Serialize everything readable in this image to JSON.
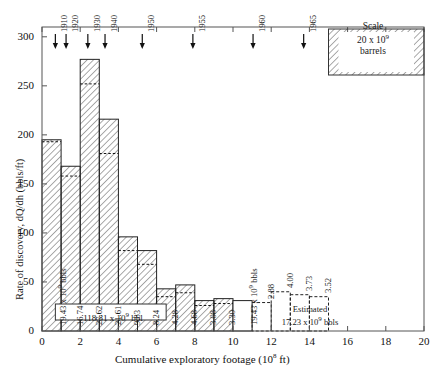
{
  "chart_data": {
    "type": "bar",
    "title": "",
    "xlabel": "Cumulative exploratory footage (10⁸ ft)",
    "ylabel": "Rate of discovery, dQ/dh (bbls/ft)",
    "xlim": [
      0,
      20
    ],
    "ylim": [
      0,
      310
    ],
    "xticks": [
      0,
      2,
      4,
      6,
      8,
      10,
      12,
      14,
      16,
      18,
      20
    ],
    "yticks": [
      0,
      50,
      100,
      150,
      200,
      250,
      300
    ],
    "grid": false,
    "legend": "none",
    "bar_width_units": 1,
    "bars": [
      {
        "x0": 0,
        "x1": 1,
        "height": 195,
        "inner": 193,
        "label": "19.43 x 10⁹ bbls",
        "style": "hatched",
        "kind": "actual"
      },
      {
        "x0": 1,
        "x1": 2,
        "height": 168,
        "inner": 158,
        "label": "16.74",
        "style": "hatched",
        "kind": "actual"
      },
      {
        "x0": 2,
        "x1": 3,
        "height": 277,
        "inner": 252,
        "label": "27.62",
        "style": "hatched",
        "kind": "actual"
      },
      {
        "x0": 3,
        "x1": 4,
        "height": 216,
        "inner": 181,
        "label": "21.61",
        "style": "hatched",
        "kind": "actual"
      },
      {
        "x0": 4,
        "x1": 5,
        "height": 96,
        "inner": 82,
        "label": "9.83",
        "style": "hatched",
        "kind": "actual"
      },
      {
        "x0": 5,
        "x1": 6,
        "height": 82,
        "inner": 68,
        "label": "8.24",
        "style": "hatched",
        "kind": "actual"
      },
      {
        "x0": 6,
        "x1": 7,
        "height": 43,
        "inner": 35,
        "label": "4.28",
        "style": "hatched",
        "kind": "actual"
      },
      {
        "x0": 7,
        "x1": 8,
        "height": 47,
        "inner": 39,
        "label": "4.68",
        "style": "hatched",
        "kind": "actual"
      },
      {
        "x0": 8,
        "x1": 9,
        "height": 31,
        "inner": 26,
        "label": "3.08",
        "style": "hatched",
        "kind": "actual"
      },
      {
        "x0": 9,
        "x1": 10,
        "height": 33,
        "inner": 28,
        "label": "3.30",
        "style": "hatched",
        "kind": "actual"
      },
      {
        "x0": 10,
        "x1": 11,
        "height": 31,
        "inner": null,
        "label": "3.10",
        "style": "open",
        "kind": "actual"
      },
      {
        "x0": 11,
        "x1": 12,
        "height": 29,
        "inner": null,
        "label": "2.88",
        "style": "dashed",
        "kind": "estimated"
      },
      {
        "x0": 12,
        "x1": 13,
        "height": 40,
        "inner": null,
        "label": "4.00",
        "style": "dashed",
        "kind": "estimated"
      },
      {
        "x0": 13,
        "x1": 14,
        "height": 37,
        "inner": null,
        "label": "3.73",
        "style": "dashed",
        "kind": "estimated"
      },
      {
        "x0": 14,
        "x1": 15,
        "height": 35,
        "inner": null,
        "label": "3.52",
        "style": "dashed",
        "kind": "estimated"
      }
    ],
    "year_markers": [
      {
        "year": "1910",
        "x": 0.7
      },
      {
        "year": "1920",
        "x": 1.26
      },
      {
        "year": "1930",
        "x": 2.4
      },
      {
        "year": "1940",
        "x": 3.3
      },
      {
        "year": "1950",
        "x": 5.25
      },
      {
        "year": "1955",
        "x": 7.9
      },
      {
        "year": "1960",
        "x": 11.05
      },
      {
        "year": "1965",
        "x": 13.7
      }
    ],
    "annotations": {
      "cumulative_total": "118.81 x 10⁹ bbl",
      "estimated_line1": "Estimated",
      "estimated_line2": "17.23 x 10⁹ bbls"
    },
    "scale_key": {
      "line1": "Scale",
      "line2": "20 x 10⁹",
      "line3": "barrels",
      "x0": 15.0,
      "x1": 20.0,
      "height": 62
    }
  }
}
